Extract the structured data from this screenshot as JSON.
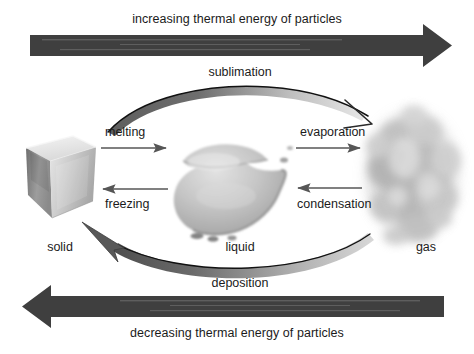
{
  "diagram": {
    "background_color": "#ffffff",
    "banner_color": "#3f3f3f",
    "arc_color": "#7d7d7d",
    "arrow_color": "#5a5a5a",
    "text_color": "#1b1b1b"
  },
  "banners": {
    "top": {
      "label": "increasing thermal energy of particles",
      "direction": "right"
    },
    "bottom": {
      "label": "decreasing thermal energy of particles",
      "direction": "left"
    }
  },
  "states": [
    {
      "key": "solid",
      "label": "solid",
      "icon": "ice-cube-icon"
    },
    {
      "key": "liquid",
      "label": "liquid",
      "icon": "water-puddle-icon"
    },
    {
      "key": "gas",
      "label": "gas",
      "icon": "vapor-cloud-icon"
    }
  ],
  "transitions": {
    "melting": {
      "label": "melting",
      "from": "solid",
      "to": "liquid",
      "direction": "right"
    },
    "freezing": {
      "label": "freezing",
      "from": "liquid",
      "to": "solid",
      "direction": "left"
    },
    "evaporation": {
      "label": "evaporation",
      "from": "liquid",
      "to": "gas",
      "direction": "right"
    },
    "condensation": {
      "label": "condensation",
      "from": "gas",
      "to": "liquid",
      "direction": "left"
    },
    "sublimation": {
      "label": "sublimation",
      "from": "solid",
      "to": "gas",
      "direction": "right"
    },
    "deposition": {
      "label": "deposition",
      "from": "gas",
      "to": "solid",
      "direction": "left"
    }
  }
}
